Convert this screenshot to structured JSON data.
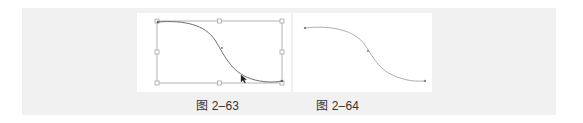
{
  "figures": [
    {
      "id": "fig-2-63",
      "caption": "图 2–63",
      "description": "S-curve path selected with transform bounding box (8 square handles) and arrow cursor",
      "bounding_box": {
        "x": 157,
        "y": 21,
        "w": 125,
        "h": 62
      },
      "line_color": "#777777",
      "box_color": "#9a9a9a"
    },
    {
      "id": "fig-2-64",
      "caption": "图 2–64",
      "description": "Same S-curve path with anchor points, no bounding box",
      "line_color": "#a8a8a8"
    }
  ],
  "colors": {
    "background_band": "#f1f1f1",
    "panel": "#ffffff",
    "caption_text": "#333333"
  }
}
